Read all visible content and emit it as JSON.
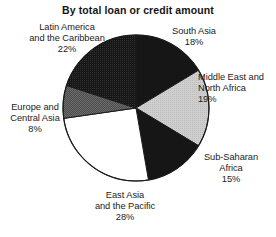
{
  "chart_data": {
    "type": "pie",
    "title": "By total loan or credit amount",
    "xlabel": "",
    "ylabel": "",
    "legend_position": "none",
    "grid": false,
    "start_angle_deg": 0,
    "direction": "clockwise",
    "categories": [
      "South Asia",
      "Middle East and North Africa",
      "Sub-Saharan Africa",
      "East Asia and the Pacific",
      "Europe and Central Asia",
      "Latin America and the Caribbean"
    ],
    "values": [
      18,
      19,
      15,
      28,
      8,
      22
    ],
    "slices": [
      {
        "id": "south-asia",
        "name": "South Asia",
        "value": 18,
        "percent_label": "18%",
        "label_lines": [
          "South Asia",
          "18%"
        ],
        "fill": "#1a1a1a",
        "fill_name": "black"
      },
      {
        "id": "middle-east-north-africa",
        "name": "Middle East and North Africa",
        "value": 19,
        "percent_label": "19%",
        "label_lines": [
          "Middle East and",
          "North Africa",
          "19%"
        ],
        "fill": "#c8c8c8",
        "fill_name": "light-gray"
      },
      {
        "id": "sub-saharan-africa",
        "name": "Sub-Saharan Africa",
        "value": 15,
        "percent_label": "15%",
        "label_lines": [
          "Sub-Saharan",
          "Africa",
          "15%"
        ],
        "fill": "#1a1a1a",
        "fill_name": "black"
      },
      {
        "id": "east-asia-pacific",
        "name": "East Asia and the Pacific",
        "value": 28,
        "percent_label": "28%",
        "label_lines": [
          "East Asia",
          "and the Pacific",
          "28%"
        ],
        "fill": "#ffffff",
        "fill_name": "white"
      },
      {
        "id": "europe-central-asia",
        "name": "Europe and Central Asia",
        "value": 8,
        "percent_label": "8%",
        "label_lines": [
          "Europe and",
          "Central Asia",
          "8%"
        ],
        "fill": "#585858",
        "fill_name": "dark-gray"
      },
      {
        "id": "latin-america-caribbean",
        "name": "Latin America and the Caribbean",
        "value": 22,
        "percent_label": "22%",
        "label_lines": [
          "Latin America",
          "and the Caribbean",
          "22%"
        ],
        "fill": "#262626",
        "fill_name": "near-black"
      }
    ],
    "colors": {
      "outline": "#1a1a1a",
      "background": "#ffffff",
      "text": "#1c1c1c"
    },
    "geometry": {
      "cx": 136,
      "cy": 108,
      "r": 73
    }
  },
  "labels": {
    "latin_america": {
      "l1": "Latin America",
      "l2": "and the Caribbean",
      "l3": "22%"
    },
    "south_asia": {
      "l1": "South Asia",
      "l2": "18%"
    },
    "middle_east": {
      "l1": "Middle East and",
      "l2": "North Africa",
      "l3": "19%"
    },
    "sub_saharan": {
      "l1": "Sub-Saharan",
      "l2": "Africa",
      "l3": "15%"
    },
    "east_asia": {
      "l1": "East Asia",
      "l2": "and the Pacific",
      "l3": "28%"
    },
    "europe": {
      "l1": "Europe and",
      "l2": "Central Asia",
      "l3": "8%"
    }
  }
}
